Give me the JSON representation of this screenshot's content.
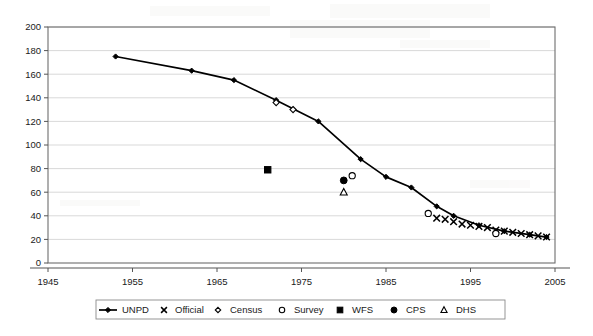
{
  "figure": {
    "title": "",
    "background_color": "#ffffff",
    "ink_color": "#000000",
    "grid_color": "#c8c8c8",
    "frame_color": "#6e6e6e"
  },
  "axes": {
    "x": {
      "label": "",
      "min": 1945,
      "max": 2005,
      "tick_step": 10,
      "tick_labels": [
        "1945",
        "1955",
        "1965",
        "1975",
        "1985",
        "1995",
        "2005"
      ],
      "tick_values": [
        1945,
        1955,
        1965,
        1975,
        1985,
        1995,
        2005
      ]
    },
    "y": {
      "label": "",
      "min": 0,
      "max": 200,
      "tick_step": 20,
      "tick_labels": [
        "0",
        "20",
        "40",
        "60",
        "80",
        "100",
        "120",
        "140",
        "160",
        "180",
        "200"
      ],
      "tick_values": [
        0,
        20,
        40,
        60,
        80,
        100,
        120,
        140,
        160,
        180,
        200
      ],
      "gridlines": true
    }
  },
  "legend": {
    "position": "bottom",
    "bordered": true,
    "entries": [
      {
        "label": "UNPD",
        "marker": "line-diamond",
        "icon_name": "legend-marker-line-diamond"
      },
      {
        "label": "Official",
        "marker": "x",
        "icon_name": "legend-marker-x"
      },
      {
        "label": "Census",
        "marker": "open-diamond",
        "icon_name": "legend-marker-open-diamond"
      },
      {
        "label": "Survey",
        "marker": "open-circle",
        "icon_name": "legend-marker-open-circle"
      },
      {
        "label": "WFS",
        "marker": "filled-square",
        "icon_name": "legend-marker-filled-square"
      },
      {
        "label": "CPS",
        "marker": "filled-circle",
        "icon_name": "legend-marker-filled-circle"
      },
      {
        "label": "DHS",
        "marker": "open-triangle",
        "icon_name": "legend-marker-open-triangle"
      }
    ]
  },
  "chart_data": {
    "type": "scatter",
    "title": "",
    "xlabel": "",
    "ylabel": "",
    "xlim": [
      1945,
      2005
    ],
    "ylim": [
      0,
      200
    ],
    "grid": true,
    "legend_position": "bottom",
    "series": [
      {
        "name": "UNPD",
        "marker": "line-diamond",
        "style": "line+marker",
        "x": [
          1953,
          1962,
          1967,
          1972,
          1977,
          1982,
          1985,
          1988,
          1991,
          1993,
          1996,
          1999,
          2002,
          2004
        ],
        "y": [
          175,
          163,
          155,
          138,
          120,
          88,
          73,
          64,
          48,
          40,
          32,
          27,
          24,
          22
        ]
      },
      {
        "name": "Official",
        "marker": "x",
        "style": "marker",
        "x": [
          1991,
          1992,
          1993,
          1994,
          1995,
          1996,
          1997,
          1998,
          1999,
          2000,
          2001,
          2002,
          2003,
          2004
        ],
        "y": [
          38,
          37,
          35,
          33,
          32,
          31,
          30,
          28,
          27,
          26,
          25,
          24,
          23,
          22
        ]
      },
      {
        "name": "Census",
        "marker": "open-diamond",
        "style": "marker",
        "x": [
          1972,
          1974
        ],
        "y": [
          136,
          130
        ]
      },
      {
        "name": "Survey",
        "marker": "open-circle",
        "style": "marker",
        "x": [
          1981,
          1990,
          1998
        ],
        "y": [
          74,
          42,
          25
        ]
      },
      {
        "name": "WFS",
        "marker": "filled-square",
        "style": "marker",
        "x": [
          1971
        ],
        "y": [
          79
        ]
      },
      {
        "name": "CPS",
        "marker": "filled-circle",
        "style": "marker",
        "x": [
          1980
        ],
        "y": [
          70
        ]
      },
      {
        "name": "DHS",
        "marker": "open-triangle",
        "style": "marker",
        "x": [
          1980
        ],
        "y": [
          60
        ]
      }
    ]
  }
}
